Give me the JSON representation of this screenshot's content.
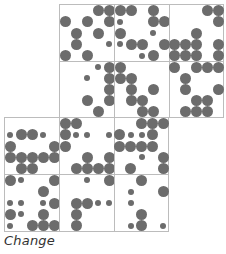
{
  "caption": "Change",
  "colors": {
    "grid_line": "#bcbcbc",
    "dot": "#6c6c6c",
    "background": "#ffffff"
  },
  "cell_size": 55,
  "sub_grid": 5,
  "cells": [
    {
      "name": "cell-r0-c0",
      "x": 59,
      "y": 4,
      "w": 55,
      "h": 57,
      "dots": [
        [
          0,
          3,
          "b"
        ],
        [
          0,
          4,
          "b"
        ],
        [
          1,
          0,
          "b"
        ],
        [
          1,
          2,
          "b"
        ],
        [
          1,
          4,
          "b"
        ],
        [
          2,
          1,
          "b"
        ],
        [
          2,
          3,
          "b"
        ],
        [
          3,
          1,
          "b"
        ],
        [
          3,
          4,
          "s"
        ],
        [
          4,
          0,
          "b"
        ],
        [
          4,
          2,
          "b"
        ]
      ]
    },
    {
      "name": "cell-r0-c1",
      "x": 114,
      "y": 4,
      "w": 55,
      "h": 57,
      "dots": [
        [
          0,
          0,
          "b"
        ],
        [
          0,
          1,
          "b"
        ],
        [
          0,
          3,
          "b"
        ],
        [
          1,
          0,
          "s"
        ],
        [
          1,
          3,
          "b"
        ],
        [
          1,
          4,
          "b"
        ],
        [
          2,
          0,
          "b"
        ],
        [
          2,
          3,
          "s"
        ],
        [
          3,
          0,
          "s"
        ],
        [
          3,
          1,
          "b"
        ],
        [
          3,
          2,
          "b"
        ],
        [
          3,
          4,
          "b"
        ],
        [
          4,
          2,
          "s"
        ],
        [
          4,
          3,
          "b"
        ]
      ]
    },
    {
      "name": "cell-r0-c2",
      "x": 169,
      "y": 4,
      "w": 54,
      "h": 57,
      "dots": [
        [
          0,
          3,
          "b"
        ],
        [
          0,
          4,
          "b"
        ],
        [
          1,
          4,
          "b"
        ],
        [
          2,
          2,
          "b"
        ],
        [
          3,
          0,
          "b"
        ],
        [
          3,
          1,
          "b"
        ],
        [
          3,
          2,
          "b"
        ],
        [
          3,
          4,
          "b"
        ],
        [
          4,
          0,
          "b"
        ],
        [
          4,
          1,
          "b"
        ],
        [
          4,
          2,
          "b"
        ],
        [
          4,
          4,
          "b"
        ]
      ]
    },
    {
      "name": "cell-r1-c0",
      "x": 59,
      "y": 61,
      "w": 55,
      "h": 56,
      "dots": [
        [
          0,
          3,
          "s"
        ],
        [
          0,
          4,
          "b"
        ],
        [
          1,
          2,
          "s"
        ],
        [
          1,
          4,
          "b"
        ],
        [
          2,
          4,
          "b"
        ],
        [
          3,
          2,
          "b"
        ],
        [
          3,
          4,
          "b"
        ],
        [
          4,
          3,
          "b"
        ]
      ]
    },
    {
      "name": "cell-r1-c1",
      "x": 114,
      "y": 61,
      "w": 55,
      "h": 56,
      "dots": [
        [
          0,
          0,
          "b"
        ],
        [
          1,
          0,
          "b"
        ],
        [
          1,
          1,
          "b"
        ],
        [
          2,
          1,
          "b"
        ],
        [
          2,
          3,
          "b"
        ],
        [
          3,
          1,
          "b"
        ],
        [
          3,
          2,
          "b"
        ],
        [
          4,
          2,
          "b"
        ],
        [
          4,
          3,
          "b"
        ]
      ]
    },
    {
      "name": "cell-r1-c2",
      "x": 169,
      "y": 61,
      "w": 54,
      "h": 56,
      "dots": [
        [
          0,
          0,
          "b"
        ],
        [
          0,
          2,
          "b"
        ],
        [
          0,
          3,
          "b"
        ],
        [
          0,
          4,
          "b"
        ],
        [
          1,
          1,
          "b"
        ],
        [
          2,
          1,
          "b"
        ],
        [
          2,
          4,
          "b"
        ],
        [
          3,
          2,
          "b"
        ],
        [
          3,
          3,
          "b"
        ],
        [
          4,
          1,
          "b"
        ],
        [
          4,
          2,
          "b"
        ],
        [
          4,
          3,
          "b"
        ]
      ]
    },
    {
      "name": "cell-r2-c0",
      "x": 4,
      "y": 117,
      "w": 55,
      "h": 57,
      "dots": [
        [
          1,
          0,
          "s"
        ],
        [
          1,
          1,
          "b"
        ],
        [
          1,
          2,
          "b"
        ],
        [
          1,
          3,
          "s"
        ],
        [
          2,
          0,
          "b"
        ],
        [
          2,
          4,
          "b"
        ],
        [
          3,
          0,
          "b"
        ],
        [
          3,
          1,
          "b"
        ],
        [
          3,
          2,
          "b"
        ],
        [
          3,
          3,
          "b"
        ],
        [
          3,
          4,
          "b"
        ],
        [
          4,
          1,
          "b"
        ],
        [
          4,
          2,
          "b"
        ]
      ]
    },
    {
      "name": "cell-r2-c1",
      "x": 59,
      "y": 117,
      "w": 55,
      "h": 57,
      "dots": [
        [
          0,
          0,
          "b"
        ],
        [
          0,
          1,
          "b"
        ],
        [
          1,
          0,
          "b"
        ],
        [
          1,
          1,
          "s"
        ],
        [
          1,
          2,
          "s"
        ],
        [
          1,
          4,
          "s"
        ],
        [
          2,
          0,
          "b"
        ],
        [
          3,
          2,
          "b"
        ],
        [
          3,
          4,
          "b"
        ],
        [
          4,
          1,
          "b"
        ],
        [
          4,
          2,
          "b"
        ],
        [
          4,
          3,
          "b"
        ],
        [
          4,
          4,
          "b"
        ]
      ]
    },
    {
      "name": "cell-r2-c2",
      "x": 114,
      "y": 117,
      "w": 54,
      "h": 57,
      "dots": [
        [
          0,
          2,
          "b"
        ],
        [
          0,
          3,
          "b"
        ],
        [
          0,
          4,
          "b"
        ],
        [
          1,
          0,
          "b"
        ],
        [
          1,
          1,
          "s"
        ],
        [
          1,
          2,
          "s"
        ],
        [
          1,
          3,
          "b"
        ],
        [
          2,
          0,
          "b"
        ],
        [
          2,
          1,
          "b"
        ],
        [
          2,
          2,
          "b"
        ],
        [
          2,
          3,
          "b"
        ],
        [
          3,
          2,
          "s"
        ],
        [
          3,
          4,
          "b"
        ],
        [
          4,
          1,
          "b"
        ],
        [
          4,
          4,
          "b"
        ]
      ]
    },
    {
      "name": "cell-r3-c0",
      "x": 4,
      "y": 174,
      "w": 55,
      "h": 57,
      "dots": [
        [
          0,
          0,
          "b"
        ],
        [
          0,
          1,
          "s"
        ],
        [
          0,
          4,
          "b"
        ],
        [
          1,
          3,
          "b"
        ],
        [
          2,
          0,
          "s"
        ],
        [
          2,
          1,
          "s"
        ],
        [
          2,
          3,
          "s"
        ],
        [
          2,
          4,
          "b"
        ],
        [
          3,
          0,
          "b"
        ],
        [
          3,
          1,
          "s"
        ],
        [
          3,
          3,
          "b"
        ],
        [
          4,
          0,
          "s"
        ],
        [
          4,
          2,
          "b"
        ],
        [
          4,
          3,
          "b"
        ],
        [
          4,
          4,
          "b"
        ]
      ]
    },
    {
      "name": "cell-r3-c1",
      "x": 59,
      "y": 174,
      "w": 55,
      "h": 57,
      "dots": [
        [
          0,
          2,
          "s"
        ],
        [
          0,
          4,
          "b"
        ],
        [
          2,
          1,
          "b"
        ],
        [
          2,
          2,
          "b"
        ],
        [
          2,
          3,
          "s"
        ],
        [
          2,
          4,
          "s"
        ],
        [
          3,
          1,
          "b"
        ],
        [
          4,
          1,
          "b"
        ]
      ]
    },
    {
      "name": "cell-r3-c2",
      "x": 114,
      "y": 174,
      "w": 54,
      "h": 57,
      "dots": [
        [
          0,
          2,
          "b"
        ],
        [
          1,
          1,
          "s"
        ],
        [
          1,
          4,
          "b"
        ],
        [
          2,
          1,
          "s"
        ],
        [
          3,
          2,
          "b"
        ],
        [
          4,
          1,
          "s"
        ],
        [
          4,
          2,
          "b"
        ],
        [
          4,
          4,
          "s"
        ]
      ]
    }
  ]
}
